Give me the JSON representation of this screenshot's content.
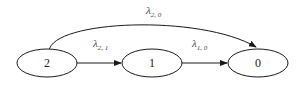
{
  "diagram": {
    "type": "state-transition",
    "nodes": [
      {
        "id": "2",
        "label": "2",
        "cx": 47,
        "cy": 63
      },
      {
        "id": "1",
        "label": "1",
        "cx": 152,
        "cy": 63
      },
      {
        "id": "0",
        "label": "0",
        "cx": 258,
        "cy": 63
      }
    ],
    "edges": [
      {
        "from": "2",
        "to": "0",
        "symbol": "λ",
        "subscript": "2, 0"
      },
      {
        "from": "2",
        "to": "1",
        "symbol": "λ",
        "subscript": "2, 1"
      },
      {
        "from": "1",
        "to": "0",
        "symbol": "λ",
        "subscript": "1, 0"
      }
    ],
    "colors": {
      "stroke": "#1a1a1a",
      "text": "#333333",
      "background": "#ffffff"
    }
  }
}
